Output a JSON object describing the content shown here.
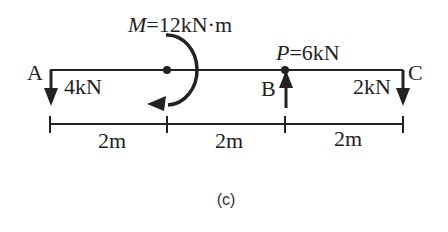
{
  "diagram": {
    "caption": "(c)",
    "moment_label_var": "M",
    "moment_label_value": "=12kN·m",
    "point_load_label_var": "P",
    "point_load_label_value": "=6kN",
    "points": {
      "A": "A",
      "B": "B",
      "C": "C"
    },
    "loads": {
      "at_A": "4kN",
      "at_C": "2kN"
    },
    "spans": [
      "2m",
      "2m",
      "2m"
    ],
    "colors": {
      "line": "#222222",
      "background": "#ffffff"
    }
  }
}
